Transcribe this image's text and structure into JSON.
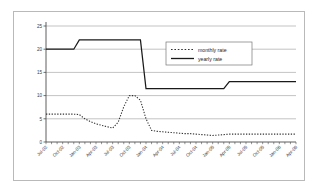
{
  "chart_data": {
    "type": "line",
    "title": "",
    "xlabel": "",
    "ylabel": "",
    "ylim": [
      0,
      25
    ],
    "yticks": [
      0,
      5,
      10,
      15,
      20,
      25
    ],
    "grid": true,
    "legend_position": "center-right-upper",
    "legend": [
      "monthly rate",
      "yearly rate"
    ],
    "x": [
      "Jul-02",
      "Aug-02",
      "Sep-02",
      "Oct-02",
      "Nov-02",
      "Dec-02",
      "Jan-03",
      "Feb-03",
      "Mar-03",
      "Apr-03",
      "May-03",
      "Jun-03",
      "Jul-03",
      "Aug-03",
      "Sep-03",
      "Oct-03",
      "Nov-03",
      "Dec-03",
      "Jan-04",
      "Feb-04",
      "Mar-04",
      "Apr-04",
      "May-04",
      "Jun-04",
      "Jul-04",
      "Aug-04",
      "Sep-04",
      "Oct-04",
      "Nov-04",
      "Dec-04",
      "Jan-05",
      "Feb-05",
      "Mar-05",
      "Apr-05",
      "May-05",
      "Jun-05",
      "Jul-05",
      "Aug-05",
      "Sep-05",
      "Oct-05",
      "Nov-05",
      "Dec-05",
      "Jan-06",
      "Feb-06",
      "Mar-06",
      "Apr-06"
    ],
    "xtick_labels": [
      "Jul-02",
      "Oct-02",
      "Jan-03",
      "Apr-03",
      "Jul-03",
      "Oct-03",
      "Jan-04",
      "Apr-04",
      "Jul-04",
      "Oct-04",
      "Jan-05",
      "Apr-05",
      "Jul-05",
      "Oct-05",
      "Jan-06",
      "Apr-06"
    ],
    "xtick_indices": [
      0,
      3,
      6,
      9,
      12,
      15,
      18,
      21,
      24,
      27,
      30,
      33,
      36,
      39,
      42,
      45
    ],
    "series": [
      {
        "name": "monthly rate",
        "style": "dotted",
        "color": "#333333",
        "values": [
          6.0,
          6.0,
          6.0,
          6.0,
          6.0,
          6.0,
          5.9,
          5.0,
          4.4,
          3.9,
          3.6,
          3.3,
          3.0,
          4.3,
          7.6,
          10.0,
          10.0,
          9.0,
          5.0,
          2.5,
          2.3,
          2.2,
          2.1,
          2.0,
          1.9,
          1.8,
          1.8,
          1.7,
          1.6,
          1.5,
          1.4,
          1.5,
          1.6,
          1.7,
          1.7,
          1.7,
          1.7,
          1.7,
          1.7,
          1.7,
          1.7,
          1.7,
          1.7,
          1.7,
          1.7,
          1.7
        ]
      },
      {
        "name": "yearly rate",
        "style": "solid",
        "color": "#1a1a1a",
        "values": [
          20.0,
          20.0,
          20.0,
          20.0,
          20.0,
          20.0,
          22.0,
          22.0,
          22.0,
          22.0,
          22.0,
          22.0,
          22.0,
          22.0,
          22.0,
          22.0,
          22.0,
          22.0,
          11.5,
          11.5,
          11.5,
          11.5,
          11.5,
          11.5,
          11.5,
          11.5,
          11.5,
          11.5,
          11.5,
          11.5,
          11.5,
          11.5,
          11.5,
          13.0,
          13.0,
          13.0,
          13.0,
          13.0,
          13.0,
          13.0,
          13.0,
          13.0,
          13.0,
          13.0,
          13.0,
          13.0
        ]
      }
    ]
  },
  "style": {
    "grid_color": "#9a9a9a",
    "axis_color": "#4d4d4d",
    "frame_color": "#b9b9b9",
    "plot_background": "#ffffff",
    "legend_border": "#777777"
  }
}
